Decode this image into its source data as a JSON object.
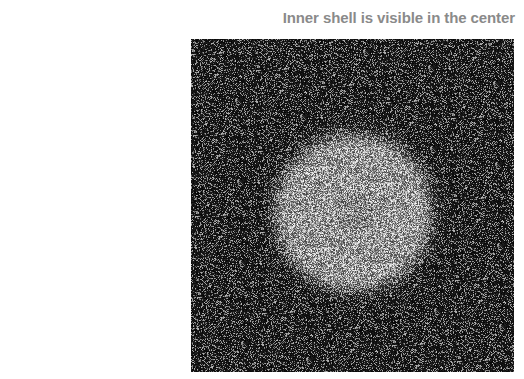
{
  "figure": {
    "title": "Inner shell is visible in the center",
    "image": {
      "description": "noisy grayscale image with a bright diffuse circular blob near center",
      "blob_center": [
        162,
        173
      ],
      "blob_radius": 66,
      "background_color": "#0a0a0a",
      "title_color": "#8a8a8a"
    }
  }
}
